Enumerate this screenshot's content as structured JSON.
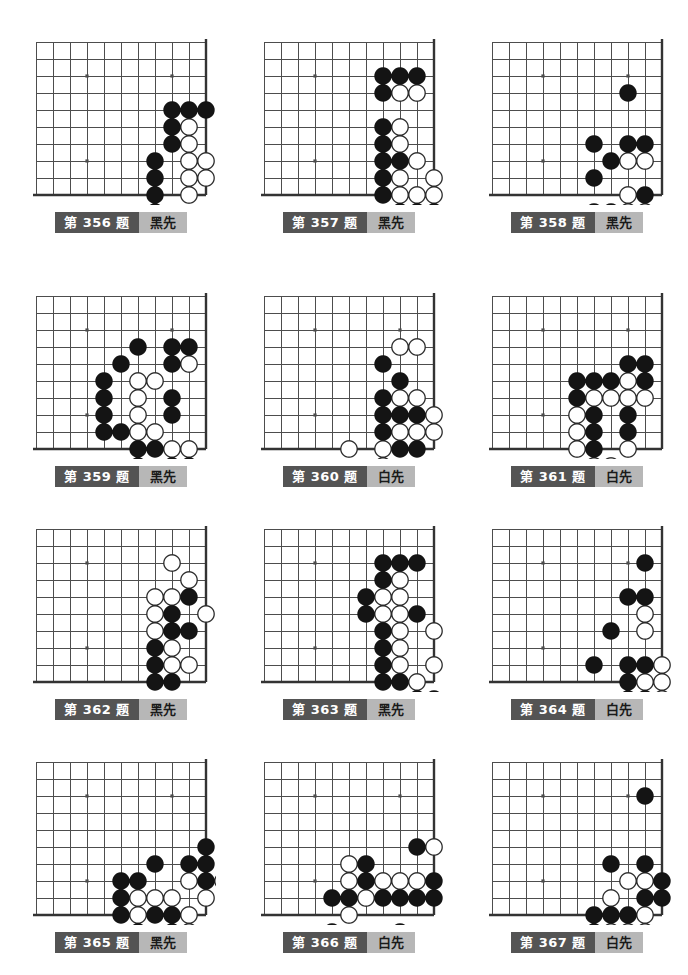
{
  "page": {
    "columns": 3,
    "rows": 4,
    "board_cols": 11,
    "board_rows": 10,
    "cell": 17,
    "stone_radius": 8.2,
    "colors": {
      "line": "#4d4d4d",
      "edge": "#333333",
      "black_stone": "#141414",
      "white_stone": "#ffffff",
      "white_outline": "#2b2b2b",
      "label_num_bg": "#545454",
      "label_num_fg": "#ffffff",
      "label_turn_bg": "#b7b7b7",
      "label_turn_fg": "#1a1a1a",
      "background": "#ffffff"
    },
    "star_points": [
      [
        3,
        2
      ],
      [
        8,
        2
      ],
      [
        3,
        7
      ]
    ]
  },
  "problems": [
    {
      "id": "356",
      "number_label": "第 356 题",
      "turn_label": "黑先",
      "turn": "black",
      "x": 26,
      "y": 32,
      "black": [
        [
          8,
          4
        ],
        [
          9,
          4
        ],
        [
          10,
          4
        ],
        [
          8,
          5
        ],
        [
          8,
          6
        ],
        [
          7,
          7
        ],
        [
          7,
          8
        ],
        [
          7,
          9
        ],
        [
          7,
          10
        ]
      ],
      "white": [
        [
          9,
          5
        ],
        [
          9,
          6
        ],
        [
          9,
          7
        ],
        [
          10,
          7
        ],
        [
          9,
          8
        ],
        [
          10,
          8
        ],
        [
          9,
          9
        ]
      ]
    },
    {
      "id": "357",
      "number_label": "第 357 题",
      "turn_label": "黑先",
      "turn": "black",
      "x": 254,
      "y": 32,
      "black": [
        [
          7,
          2
        ],
        [
          8,
          2
        ],
        [
          9,
          2
        ],
        [
          7,
          3
        ],
        [
          7,
          5
        ],
        [
          7,
          6
        ],
        [
          7,
          7
        ],
        [
          8,
          7
        ],
        [
          7,
          8
        ],
        [
          7,
          9
        ],
        [
          8,
          10
        ],
        [
          9,
          10
        ],
        [
          10,
          10
        ]
      ],
      "white": [
        [
          8,
          3
        ],
        [
          9,
          3
        ],
        [
          8,
          5
        ],
        [
          8,
          6
        ],
        [
          9,
          7
        ],
        [
          8,
          8
        ],
        [
          10,
          8
        ],
        [
          8,
          9
        ],
        [
          9,
          9
        ],
        [
          10,
          9
        ]
      ]
    },
    {
      "id": "358",
      "number_label": "第 358 题",
      "turn_label": "黑先",
      "turn": "black",
      "x": 482,
      "y": 32,
      "black": [
        [
          8,
          3
        ],
        [
          6,
          6
        ],
        [
          8,
          6
        ],
        [
          9,
          6
        ],
        [
          7,
          7
        ],
        [
          6,
          8
        ],
        [
          9,
          9
        ],
        [
          6,
          10
        ],
        [
          7,
          10
        ]
      ],
      "white": [
        [
          8,
          7
        ],
        [
          9,
          7
        ],
        [
          8,
          9
        ],
        [
          8,
          10
        ],
        [
          9,
          10
        ]
      ]
    },
    {
      "id": "359",
      "number_label": "第 359 题",
      "turn_label": "黑先",
      "turn": "black",
      "x": 26,
      "y": 286,
      "black": [
        [
          6,
          3
        ],
        [
          8,
          3
        ],
        [
          9,
          3
        ],
        [
          5,
          4
        ],
        [
          8,
          4
        ],
        [
          4,
          5
        ],
        [
          4,
          6
        ],
        [
          8,
          6
        ],
        [
          4,
          7
        ],
        [
          8,
          7
        ],
        [
          4,
          8
        ],
        [
          5,
          8
        ],
        [
          6,
          9
        ],
        [
          7,
          9
        ],
        [
          6,
          10
        ],
        [
          8,
          10
        ],
        [
          9,
          10
        ]
      ],
      "white": [
        [
          9,
          4
        ],
        [
          6,
          5
        ],
        [
          7,
          5
        ],
        [
          6,
          6
        ],
        [
          6,
          7
        ],
        [
          6,
          8
        ],
        [
          7,
          8
        ],
        [
          8,
          9
        ],
        [
          9,
          9
        ]
      ]
    },
    {
      "id": "360",
      "number_label": "第 360 题",
      "turn_label": "白先",
      "turn": "white",
      "x": 254,
      "y": 286,
      "black": [
        [
          7,
          4
        ],
        [
          8,
          5
        ],
        [
          7,
          6
        ],
        [
          7,
          7
        ],
        [
          8,
          7
        ],
        [
          9,
          7
        ],
        [
          7,
          8
        ],
        [
          8,
          9
        ],
        [
          9,
          9
        ]
      ],
      "white": [
        [
          8,
          3
        ],
        [
          9,
          3
        ],
        [
          8,
          6
        ],
        [
          9,
          6
        ],
        [
          10,
          7
        ],
        [
          8,
          8
        ],
        [
          9,
          8
        ],
        [
          10,
          8
        ],
        [
          5,
          9
        ],
        [
          7,
          9
        ],
        [
          7,
          10
        ]
      ]
    },
    {
      "id": "361",
      "number_label": "第 361 题",
      "turn_label": "白先",
      "turn": "white",
      "x": 482,
      "y": 286,
      "black": [
        [
          8,
          4
        ],
        [
          9,
          4
        ],
        [
          5,
          5
        ],
        [
          6,
          5
        ],
        [
          7,
          5
        ],
        [
          9,
          5
        ],
        [
          5,
          6
        ],
        [
          6,
          7
        ],
        [
          8,
          7
        ],
        [
          6,
          8
        ],
        [
          8,
          8
        ],
        [
          6,
          9
        ]
      ],
      "white": [
        [
          8,
          5
        ],
        [
          6,
          6
        ],
        [
          7,
          6
        ],
        [
          8,
          6
        ],
        [
          9,
          6
        ],
        [
          5,
          7
        ],
        [
          5,
          8
        ],
        [
          5,
          9
        ],
        [
          8,
          9
        ],
        [
          6,
          10
        ],
        [
          7,
          10
        ]
      ]
    },
    {
      "id": "362",
      "number_label": "第 362 题",
      "turn_label": "黑先",
      "turn": "black",
      "x": 26,
      "y": 519,
      "black": [
        [
          9,
          4
        ],
        [
          8,
          5
        ],
        [
          8,
          6
        ],
        [
          9,
          6
        ],
        [
          7,
          7
        ],
        [
          7,
          8
        ],
        [
          7,
          9
        ],
        [
          8,
          9
        ]
      ],
      "white": [
        [
          8,
          2
        ],
        [
          9,
          3
        ],
        [
          7,
          4
        ],
        [
          8,
          4
        ],
        [
          10,
          5
        ],
        [
          7,
          5
        ],
        [
          7,
          6
        ],
        [
          8,
          7
        ],
        [
          8,
          8
        ],
        [
          9,
          8
        ]
      ]
    },
    {
      "id": "363",
      "number_label": "第 363 题",
      "turn_label": "黑先",
      "turn": "black",
      "x": 254,
      "y": 519,
      "black": [
        [
          7,
          2
        ],
        [
          8,
          2
        ],
        [
          9,
          2
        ],
        [
          7,
          3
        ],
        [
          6,
          4
        ],
        [
          6,
          5
        ],
        [
          9,
          5
        ],
        [
          7,
          6
        ],
        [
          7,
          7
        ],
        [
          7,
          8
        ],
        [
          7,
          9
        ],
        [
          8,
          9
        ],
        [
          9,
          10
        ],
        [
          10,
          10
        ]
      ],
      "white": [
        [
          8,
          3
        ],
        [
          7,
          4
        ],
        [
          8,
          4
        ],
        [
          7,
          5
        ],
        [
          8,
          5
        ],
        [
          8,
          6
        ],
        [
          10,
          6
        ],
        [
          8,
          7
        ],
        [
          8,
          8
        ],
        [
          10,
          8
        ],
        [
          9,
          9
        ]
      ]
    },
    {
      "id": "364",
      "number_label": "第 364 题",
      "turn_label": "白先",
      "turn": "white",
      "x": 482,
      "y": 519,
      "black": [
        [
          9,
          2
        ],
        [
          8,
          4
        ],
        [
          9,
          4
        ],
        [
          7,
          6
        ],
        [
          6,
          8
        ],
        [
          8,
          8
        ],
        [
          9,
          8
        ],
        [
          8,
          9
        ],
        [
          8,
          10
        ],
        [
          9,
          10
        ],
        [
          10,
          11
        ]
      ],
      "white": [
        [
          9,
          5
        ],
        [
          9,
          6
        ],
        [
          10,
          8
        ],
        [
          9,
          9
        ],
        [
          10,
          9
        ],
        [
          10,
          10
        ]
      ]
    },
    {
      "id": "365",
      "number_label": "第 365 题",
      "turn_label": "黑先",
      "turn": "black",
      "x": 26,
      "y": 752,
      "black": [
        [
          10,
          5
        ],
        [
          7,
          6
        ],
        [
          9,
          6
        ],
        [
          10,
          6
        ],
        [
          5,
          7
        ],
        [
          6,
          7
        ],
        [
          10,
          7
        ],
        [
          5,
          8
        ],
        [
          5,
          9
        ],
        [
          7,
          9
        ],
        [
          8,
          9
        ],
        [
          6,
          10
        ],
        [
          8,
          10
        ],
        [
          7,
          11
        ]
      ],
      "white": [
        [
          9,
          7
        ],
        [
          11,
          7
        ],
        [
          6,
          8
        ],
        [
          7,
          8
        ],
        [
          8,
          8
        ],
        [
          10,
          8
        ],
        [
          6,
          9
        ],
        [
          9,
          9
        ],
        [
          9,
          10
        ]
      ]
    },
    {
      "id": "366",
      "number_label": "第 366 题",
      "turn_label": "白先",
      "turn": "white",
      "x": 254,
      "y": 752,
      "black": [
        [
          9,
          5
        ],
        [
          6,
          6
        ],
        [
          6,
          7
        ],
        [
          10,
          7
        ],
        [
          4,
          8
        ],
        [
          5,
          8
        ],
        [
          7,
          8
        ],
        [
          8,
          8
        ],
        [
          9,
          8
        ],
        [
          10,
          8
        ],
        [
          4,
          10
        ],
        [
          8,
          10
        ]
      ],
      "white": [
        [
          10,
          5
        ],
        [
          5,
          6
        ],
        [
          5,
          7
        ],
        [
          7,
          7
        ],
        [
          8,
          7
        ],
        [
          9,
          7
        ],
        [
          6,
          8
        ],
        [
          5,
          9
        ]
      ]
    },
    {
      "id": "367",
      "number_label": "第 367 题",
      "turn_label": "白先",
      "turn": "white",
      "x": 482,
      "y": 752,
      "black": [
        [
          9,
          2
        ],
        [
          7,
          6
        ],
        [
          9,
          6
        ],
        [
          10,
          7
        ],
        [
          9,
          8
        ],
        [
          10,
          8
        ],
        [
          6,
          9
        ],
        [
          7,
          9
        ],
        [
          8,
          9
        ],
        [
          6,
          10
        ],
        [
          10,
          11
        ]
      ],
      "white": [
        [
          8,
          7
        ],
        [
          9,
          7
        ],
        [
          7,
          8
        ],
        [
          7,
          10
        ],
        [
          8,
          10
        ],
        [
          9,
          10
        ],
        [
          9,
          9
        ]
      ]
    }
  ]
}
